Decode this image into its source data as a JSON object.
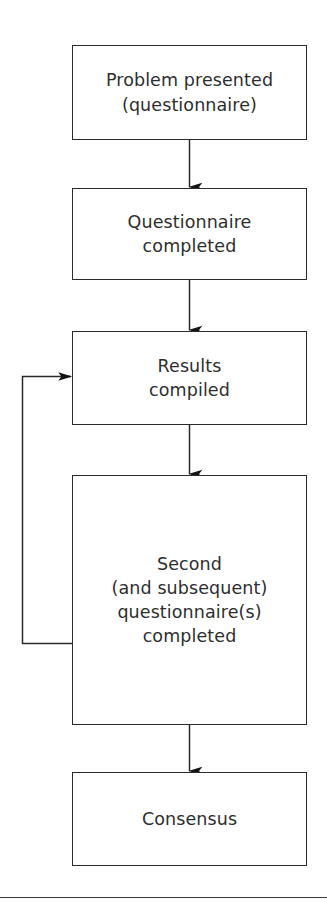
{
  "figure": {
    "type": "flowchart",
    "orientation": "vertical",
    "background_color": "#ffffff",
    "line_color": "#2b2b2b",
    "text_color": "#2e2e2e"
  },
  "nodes": [
    {
      "id": "problem",
      "label": "Problem presented\n(questionnaire)",
      "shape": "rectangle"
    },
    {
      "id": "completed",
      "label": "Questionnaire\ncompleted",
      "shape": "rectangle"
    },
    {
      "id": "results",
      "label": "Results\ncompiled",
      "shape": "rectangle"
    },
    {
      "id": "second",
      "label": "Second\n(and subsequent)\nquestionnaire(s)\ncompleted",
      "shape": "rectangle"
    },
    {
      "id": "consensus",
      "label": "Consensus",
      "shape": "rectangle"
    }
  ],
  "edges": [
    {
      "id": "e1",
      "from": "problem",
      "to": "completed",
      "style": "straight-down",
      "arrow": "filled"
    },
    {
      "id": "e2",
      "from": "completed",
      "to": "results",
      "style": "straight-down",
      "arrow": "filled"
    },
    {
      "id": "e3",
      "from": "results",
      "to": "second",
      "style": "straight-down",
      "arrow": "filled"
    },
    {
      "id": "e4",
      "from": "second",
      "to": "consensus",
      "style": "straight-down",
      "arrow": "filled"
    },
    {
      "id": "e5",
      "from": "second",
      "to": "results",
      "style": "feedback-loop-left",
      "arrow": "filled"
    }
  ],
  "rule": {
    "id": "bottom-rule",
    "description": "horizontal separator line"
  }
}
